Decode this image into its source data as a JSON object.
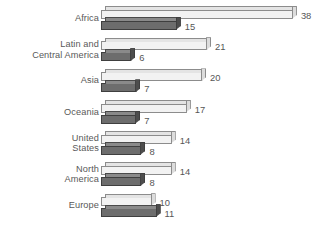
{
  "chart_data": {
    "type": "bar",
    "orientation": "horizontal",
    "title": "",
    "xlabel": "",
    "ylabel": "",
    "grid": false,
    "legend": "none",
    "xlim": [
      0,
      38
    ],
    "categories": [
      "Africa",
      "Latin and\nCentral America",
      "Asia",
      "Oceania",
      "United\nStates",
      "North\nAmerica",
      "Europe"
    ],
    "series": [
      {
        "name": "light",
        "values": [
          38,
          21,
          20,
          17,
          14,
          14,
          10
        ]
      },
      {
        "name": "dark",
        "values": [
          15,
          6,
          7,
          7,
          8,
          8,
          11
        ]
      }
    ],
    "colors": {
      "light_bar": "#f2f2f2",
      "dark_bar": "#6d6d6d",
      "outline": "#8c8c8c",
      "text": "#565656",
      "background": "#ffffff"
    }
  }
}
